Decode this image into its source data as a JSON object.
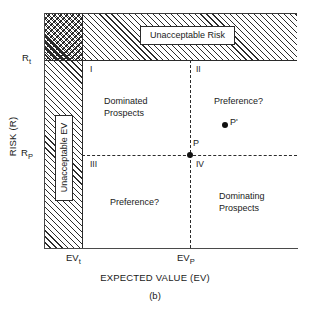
{
  "figure": {
    "caption": "(b)",
    "axes": {
      "x_title": "EXPECTED VALUE (EV)",
      "y_title": "RISK (R)",
      "x_ticks": [
        {
          "label": "EV",
          "sub": "t"
        },
        {
          "label": "EV",
          "sub": "P"
        }
      ],
      "y_ticks": [
        {
          "label": "R",
          "sub": "t"
        },
        {
          "label": "R",
          "sub": "P"
        }
      ]
    },
    "bands": {
      "unacceptable_risk": "Unacceptable Risk",
      "unacceptable_ev": "Unacceptable EV"
    },
    "quadrants": [
      {
        "numeral": "I",
        "label": "Dominated\nProspects"
      },
      {
        "numeral": "II",
        "label": "Preference?"
      },
      {
        "numeral": "III",
        "label": "Preference?"
      },
      {
        "numeral": "IV",
        "label": "Dominating\nProspects"
      }
    ],
    "quadrant_numerals": {
      "i": "I",
      "ii": "II",
      "iii": "III",
      "iv": "IV"
    },
    "region_labels": {
      "dominated_prospects_line1": "Dominated",
      "dominated_prospects_line2": "Prospects",
      "preference_ii": "Preference?",
      "preference_iii": "Preference?",
      "dominating_prospects_line1": "Dominating",
      "dominating_prospects_line2": "Prospects"
    },
    "points": [
      {
        "name": "P",
        "label": "P"
      },
      {
        "name": "Pp",
        "label": "P'"
      }
    ],
    "point_labels": {
      "p": "P",
      "p_prime": "P'"
    },
    "colors": {
      "ink": "#1a1a1a",
      "hatch": "#2b2b2b",
      "axis": "#4a4a4a",
      "background": "#ffffff"
    }
  },
  "chart_data": {
    "type": "scatter",
    "title": "",
    "subtitle": "(b)",
    "xlabel": "EXPECTED VALUE (EV)",
    "ylabel": "RISK (R)",
    "grid": false,
    "legend": "none",
    "xticks": [
      "EVt",
      "EVp"
    ],
    "yticks": [
      "Rp",
      "Rt"
    ],
    "xtick_positions": [
      0.15,
      0.58
    ],
    "ytick_positions": [
      0.4,
      0.8
    ],
    "xlim": [
      0,
      1
    ],
    "ylim": [
      0,
      1
    ],
    "points": [
      {
        "label": "P",
        "x": 0.58,
        "y": 0.4
      },
      {
        "label": "P'",
        "x": 0.7,
        "y": 0.53
      }
    ],
    "reference_lines": [
      {
        "orientation": "horizontal",
        "value": 0.4,
        "style": "dashed",
        "tick": "Rp"
      },
      {
        "orientation": "vertical",
        "value": 0.58,
        "style": "dashed",
        "tick": "EVp"
      },
      {
        "orientation": "horizontal",
        "value": 0.8,
        "style": "solid",
        "tick": "Rt"
      },
      {
        "orientation": "vertical",
        "value": 0.15,
        "style": "solid",
        "tick": "EVt"
      }
    ],
    "shaded_regions": [
      {
        "name": "Unacceptable Risk",
        "fill": "diagonal-hatch",
        "y_range": [
          0.8,
          1.0
        ],
        "x_range": [
          0.0,
          1.0
        ]
      },
      {
        "name": "Unacceptable EV",
        "fill": "diagonal-hatch",
        "x_range": [
          0.0,
          0.15
        ],
        "y_range": [
          0.0,
          1.0
        ]
      },
      {
        "name": "Overlap",
        "fill": "cross-hatch",
        "x_range": [
          0.0,
          0.15
        ],
        "y_range": [
          0.8,
          1.0
        ]
      }
    ],
    "quadrants": [
      {
        "numeral": "I",
        "annotation": "Dominated Prospects",
        "x_range": [
          0.15,
          0.58
        ],
        "y_range": [
          0.4,
          0.8
        ]
      },
      {
        "numeral": "II",
        "annotation": "Preference?",
        "x_range": [
          0.58,
          1.0
        ],
        "y_range": [
          0.4,
          0.8
        ]
      },
      {
        "numeral": "III",
        "annotation": "Preference?",
        "x_range": [
          0.15,
          0.58
        ],
        "y_range": [
          0.0,
          0.4
        ]
      },
      {
        "numeral": "IV",
        "annotation": "Dominating Prospects",
        "x_range": [
          0.58,
          1.0
        ],
        "y_range": [
          0.0,
          0.4
        ]
      }
    ]
  }
}
